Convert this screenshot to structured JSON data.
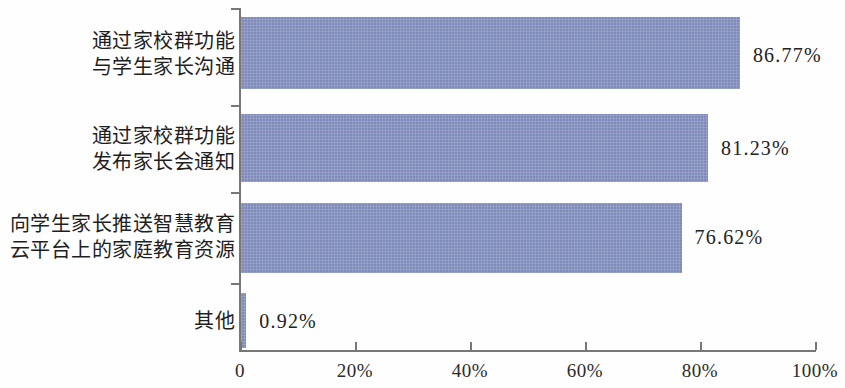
{
  "chart_data": {
    "type": "bar",
    "orientation": "horizontal",
    "title": "",
    "subtitle": "",
    "xlabel": "",
    "ylabel": "",
    "xlim": [
      0,
      100
    ],
    "grid": false,
    "legend": null,
    "bar_color": "#8490c0",
    "axis_color": "#777777",
    "categories": [
      "通过家校群功能与学生家长沟通",
      "通过家校群功能发布家长会通知",
      "向学生家长推送智慧教育云平台上的家庭教育资源",
      "其他"
    ],
    "category_lines": [
      [
        "通过家校群功能",
        "与学生家长沟通"
      ],
      [
        "通过家校群功能",
        "发布家长会通知"
      ],
      [
        "向学生家长推送智慧教育",
        "云平台上的家庭教育资源"
      ],
      [
        "其他"
      ]
    ],
    "values": [
      86.77,
      81.23,
      76.62,
      0.92
    ],
    "value_labels": [
      "86.77%",
      "81.23%",
      "76.62%",
      "0.92%"
    ],
    "xticks": [
      0,
      20,
      40,
      60,
      80,
      100
    ],
    "xtick_labels": [
      "0",
      "20%",
      "40%",
      "60%",
      "80%",
      "100%"
    ]
  }
}
